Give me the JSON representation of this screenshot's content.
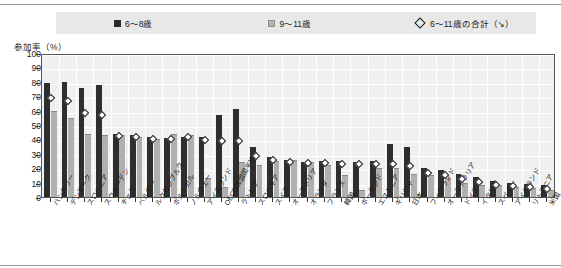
{
  "legend": {
    "items": [
      {
        "label": "6〜8歳",
        "type": "dark-square"
      },
      {
        "label": "9〜11歳",
        "type": "light-square"
      },
      {
        "label": "6〜11歳の合計（↘）",
        "type": "diamond"
      }
    ]
  },
  "axis": {
    "y_caption": "参加率（%）"
  },
  "chart_data": {
    "type": "bar",
    "title": "",
    "xlabel": "",
    "ylabel": "参加率（%）",
    "ylim": [
      0,
      100
    ],
    "yticks": [
      0,
      10,
      20,
      30,
      40,
      50,
      60,
      70,
      80,
      90,
      100
    ],
    "grid": true,
    "legend_position": "top",
    "categories": [
      "ハンガリー",
      "デンマーク",
      "スロベニア",
      "スウェーデン",
      "チェコ",
      "ベルギー",
      "ルクセンブルク",
      "ポルトガル",
      "ノルウェー",
      "アイスランド",
      "OECD加盟国平均",
      "ラトビア",
      "スロバキア",
      "スイス",
      "オーストリア",
      "オランダ",
      "フランス",
      "韓国",
      "ポーランド",
      "エストニア",
      "ギリシャ",
      "日本",
      "フィンランド",
      "オーストラリア",
      "ドイツ",
      "イタリア",
      "スペイン",
      "アイルランド",
      "リトアニア",
      "米国"
    ],
    "series": [
      {
        "name": "6〜8歳",
        "marker": "dark-square",
        "values": [
          79,
          80,
          76,
          78,
          44,
          43,
          42,
          41,
          42,
          42,
          57,
          61,
          35,
          28,
          26,
          24,
          25,
          25,
          24,
          25,
          37,
          35,
          20,
          19,
          16,
          14,
          11,
          10,
          9,
          8
        ]
      },
      {
        "name": "9〜11歳",
        "marker": "light-square",
        "values": [
          60,
          55,
          44,
          43,
          43,
          42,
          40,
          44,
          43,
          13,
          7,
          24,
          22,
          25,
          26,
          24,
          22,
          15,
          5,
          20,
          20,
          16,
          15,
          13,
          10,
          8,
          8,
          7,
          6,
          5
        ]
      }
    ],
    "overlay": {
      "name": "6〜11歳の合計（↘）",
      "marker": "diamond",
      "values": [
        70,
        68,
        60,
        58,
        44,
        43,
        42,
        42,
        43,
        41,
        40,
        40,
        30,
        27,
        26,
        25,
        25,
        24,
        24,
        24,
        24,
        23,
        18,
        17,
        14,
        12,
        10,
        9,
        8,
        7
      ]
    }
  }
}
